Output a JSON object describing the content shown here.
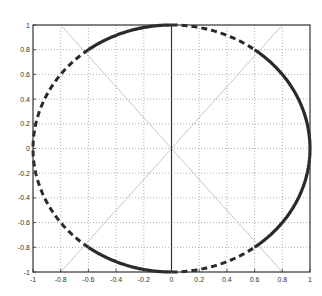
{
  "chart_data": {
    "type": "line",
    "title": "",
    "xlabel": "",
    "ylabel": "",
    "xlim": [
      -1,
      1
    ],
    "ylim": [
      -1,
      1
    ],
    "grid": true,
    "legend": null,
    "xticks": [
      "-1",
      "-0.8",
      "-0.6",
      "-0.4",
      "-0.2",
      "0",
      "0.2",
      "0.4",
      "0.6",
      "0.8",
      "1"
    ],
    "yticks": [
      "-1",
      "-0.8",
      "-0.6",
      "-0.4",
      "-0.2",
      "0",
      "0.2",
      "0.4",
      "0.6",
      "0.8",
      "1"
    ],
    "series": [
      {
        "name": "unit circle (solid arcs)",
        "style": "solid",
        "segments": [
          {
            "from": [
              -0.6,
              0.8
            ],
            "to": [
              0,
              1
            ]
          },
          {
            "from": [
              0.6,
              0.8
            ],
            "to": [
              1,
              0
            ],
            "via": "right",
            "end": [
              0.6,
              -0.8
            ]
          },
          {
            "from": [
              -0.6,
              -0.8
            ],
            "to": [
              0,
              -1
            ]
          }
        ]
      },
      {
        "name": "unit circle (dashed arcs)",
        "style": "dashed",
        "segments": [
          {
            "from": [
              0,
              1
            ],
            "to": [
              0.6,
              0.8
            ]
          },
          {
            "from": [
              -0.6,
              0.8
            ],
            "to": [
              -1,
              0
            ],
            "via": "left",
            "end": [
              -0.6,
              -0.8
            ]
          },
          {
            "from": [
              0,
              -1
            ],
            "to": [
              0.6,
              -0.8
            ]
          }
        ]
      },
      {
        "name": "diagonal 1",
        "style": "thin",
        "points": [
          [
            -0.8,
            1
          ],
          [
            0.8,
            -1
          ]
        ]
      },
      {
        "name": "diagonal 2",
        "style": "thin",
        "points": [
          [
            -0.8,
            -1
          ],
          [
            0.8,
            1
          ]
        ]
      },
      {
        "name": "x=0 axis line",
        "style": "solid-thin",
        "points": [
          [
            0,
            -1
          ],
          [
            0,
            1
          ]
        ]
      }
    ]
  },
  "colors": {
    "curve": "#2a2a2a",
    "grid": "#9a9a9a",
    "diagonal": "#b0b0b0",
    "axes": "#333333"
  }
}
